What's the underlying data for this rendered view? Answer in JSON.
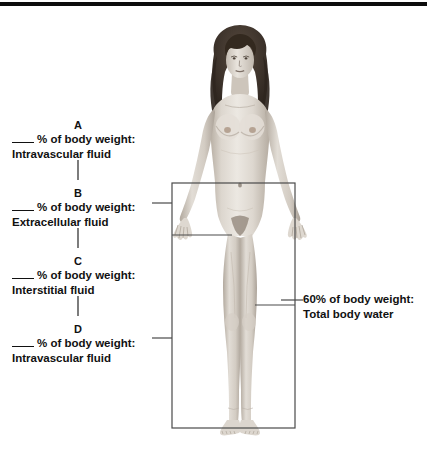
{
  "figure": {
    "alt_name": "adult-female-body-outline"
  },
  "colors": {
    "rule": "#0d0d0d",
    "box_stroke": "#4a4a4a",
    "text": "#111111",
    "skin_light": "#e3ddd6",
    "skin_mid": "#cfc7bd",
    "skin_shadow": "#b3a99d",
    "hair": "#3a3029"
  },
  "top_rule": {
    "name": "header-divider"
  },
  "callouts": {
    "a": {
      "key": "A",
      "line1_prefix": "",
      "line1": "% of body weight:",
      "line2": "Intravascular fluid"
    },
    "b": {
      "key": "B",
      "line1": "% of body weight:",
      "line2": "Extracellular fluid"
    },
    "c": {
      "key": "C",
      "line1": "% of body weight:",
      "line2": "Interstitial fluid"
    },
    "d": {
      "key": "D",
      "line1": "% of body weight:",
      "line2": "Intravascular fluid"
    },
    "total": {
      "line1": "60% of body weight:",
      "line2": "Total body water"
    }
  }
}
